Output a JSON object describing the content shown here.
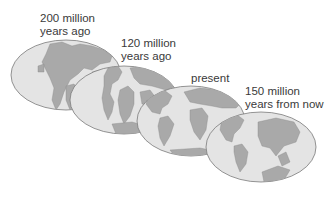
{
  "diagram": {
    "stages": [
      {
        "id": "200mya",
        "line1": "200 million",
        "line2": "years ago"
      },
      {
        "id": "120mya",
        "line1": "120 million",
        "line2": "years ago"
      },
      {
        "id": "present",
        "line1": "present",
        "line2": ""
      },
      {
        "id": "150mfuture",
        "line1": "150 million",
        "line2": "years from now"
      }
    ],
    "colors": {
      "ocean": "#e4e4e4",
      "land": "#a9a9a9",
      "outline": "#7a7a7a",
      "text": "#3a3a3a"
    }
  }
}
